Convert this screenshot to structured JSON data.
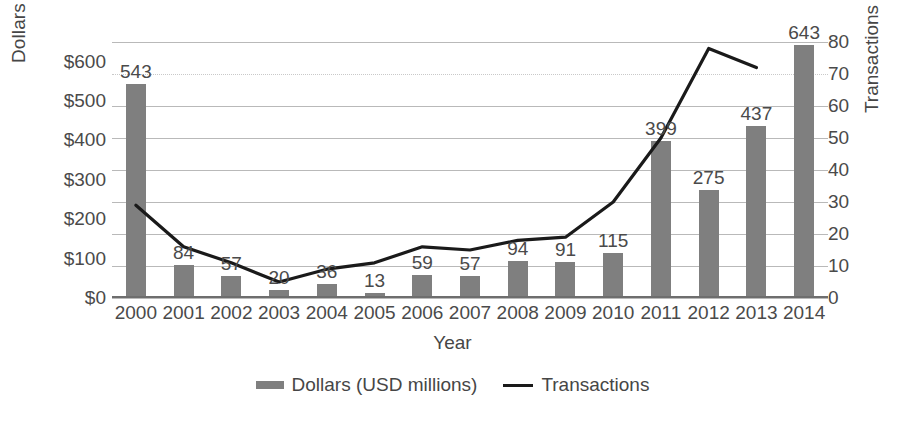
{
  "chart_data": {
    "type": "bar",
    "title": "",
    "xlabel": "Year",
    "ylabel": "Dollars (USD millions)",
    "ylabel_secondary": "Transactions",
    "categories": [
      "2000",
      "2001",
      "2002",
      "2003",
      "2004",
      "2005",
      "2006",
      "2007",
      "2008",
      "2009",
      "2010",
      "2011",
      "2012",
      "2013",
      "2014"
    ],
    "ylim": [
      0,
      650
    ],
    "ylim_secondary": [
      0,
      80
    ],
    "yticks": [
      "$0",
      "$100",
      "$200",
      "$300",
      "$400",
      "$500",
      "$600"
    ],
    "ytick_values": [
      0,
      100,
      200,
      300,
      400,
      500,
      600
    ],
    "yticks_secondary": [
      "0",
      "10",
      "20",
      "30",
      "40",
      "50",
      "60",
      "70",
      "80"
    ],
    "ytick_values_secondary": [
      0,
      10,
      20,
      30,
      40,
      50,
      60,
      70,
      80
    ],
    "grid": true,
    "legend_position": "bottom",
    "series": [
      {
        "name": "Dollars (USD millions)",
        "type": "bar",
        "axis": "left",
        "color": "#7f7f7f",
        "values": [
          543,
          84,
          57,
          20,
          36,
          13,
          59,
          57,
          94,
          91,
          115,
          399,
          275,
          437,
          643
        ],
        "labels": [
          "543",
          "84",
          "57",
          "20",
          "36",
          "13",
          "59",
          "57",
          "94",
          "91",
          "115",
          "399",
          "275",
          "437",
          "643"
        ]
      },
      {
        "name": "Transactions",
        "type": "line",
        "axis": "right",
        "color": "#1a1a1a",
        "values": [
          29,
          16,
          11,
          5,
          9,
          11,
          16,
          15,
          18,
          19,
          30,
          50,
          78,
          72,
          null
        ]
      }
    ],
    "legend": [
      {
        "label": "Dollars (USD millions)",
        "marker": "bar-swatch",
        "color": "#7f7f7f"
      },
      {
        "label": "Transactions",
        "marker": "line-swatch",
        "color": "#1a1a1a"
      }
    ]
  }
}
